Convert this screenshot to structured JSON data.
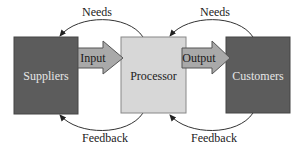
{
  "diagram": {
    "type": "flow",
    "colors": {
      "dark_box": "#5c5c5c",
      "light_box": "#d7d7d7",
      "arrow_fill": "#a9a9a9",
      "line": "#333333",
      "dark_text": "#e6e6e6",
      "light_text": "#222222"
    },
    "nodes": [
      {
        "id": "suppliers",
        "label": "Suppliers"
      },
      {
        "id": "processor",
        "label": "Processor"
      },
      {
        "id": "customers",
        "label": "Customers"
      }
    ],
    "flows": [
      {
        "id": "input",
        "label": "Input",
        "from": "suppliers",
        "to": "processor"
      },
      {
        "id": "output",
        "label": "Output",
        "from": "processor",
        "to": "customers"
      }
    ],
    "loops": [
      {
        "id": "needs-left",
        "label": "Needs",
        "from": "processor",
        "to": "suppliers",
        "position": "top"
      },
      {
        "id": "needs-right",
        "label": "Needs",
        "from": "customers",
        "to": "processor",
        "position": "top"
      },
      {
        "id": "feedback-left",
        "label": "Feedback",
        "from": "processor",
        "to": "suppliers",
        "position": "bottom"
      },
      {
        "id": "feedback-right",
        "label": "Feedback",
        "from": "customers",
        "to": "processor",
        "position": "bottom"
      }
    ]
  }
}
